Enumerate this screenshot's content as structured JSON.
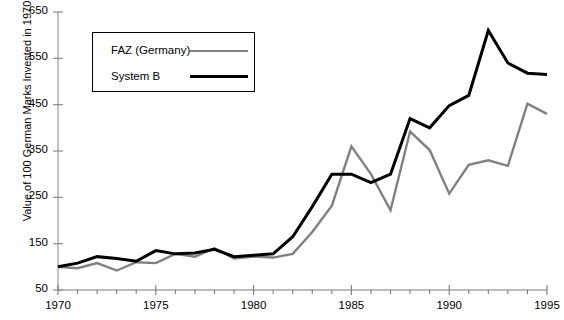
{
  "chart_data": {
    "type": "line",
    "title": "",
    "xlabel": "",
    "ylabel": "Value of 100 German Marks Invested in 1970",
    "xlim": [
      1970,
      1995
    ],
    "ylim": [
      50,
      650
    ],
    "ytick_step": 100,
    "yticks": [
      50,
      150,
      250,
      350,
      450,
      550,
      650
    ],
    "ytick_labels": [
      "50",
      "150",
      "250",
      "350",
      "450",
      "550",
      "650"
    ],
    "xticks": [
      1970,
      1971,
      1972,
      1973,
      1974,
      1975,
      1976,
      1977,
      1978,
      1979,
      1980,
      1981,
      1982,
      1983,
      1984,
      1985,
      1986,
      1987,
      1988,
      1989,
      1990,
      1991,
      1992,
      1993,
      1994,
      1995
    ],
    "xtick_labels_shown": [
      "1970",
      "1975",
      "1980",
      "1985",
      "1990",
      "1995"
    ],
    "xtick_labels_shown_values": [
      1970,
      1975,
      1980,
      1985,
      1990,
      1995
    ],
    "grid": false,
    "legend_position": "upper-left-inset",
    "x": [
      1970,
      1971,
      1972,
      1973,
      1974,
      1975,
      1976,
      1977,
      1978,
      1979,
      1980,
      1981,
      1982,
      1983,
      1984,
      1985,
      1986,
      1987,
      1988,
      1989,
      1990,
      1991,
      1992,
      1993,
      1994,
      1995
    ],
    "series": [
      {
        "name": "FAZ (Germany)",
        "color": "#808080",
        "width": 2.4,
        "values": [
          100,
          97,
          108,
          92,
          110,
          108,
          128,
          122,
          140,
          118,
          122,
          120,
          128,
          175,
          232,
          360,
          300,
          222,
          392,
          352,
          258,
          320,
          330,
          318,
          452,
          430
        ]
      },
      {
        "name": "System B",
        "color": "#000000",
        "width": 3.0,
        "values": [
          100,
          108,
          122,
          118,
          112,
          135,
          128,
          130,
          138,
          122,
          125,
          128,
          165,
          230,
          300,
          300,
          282,
          300,
          420,
          400,
          448,
          470,
          610,
          540,
          518,
          515
        ]
      }
    ]
  },
  "legend": {
    "items": [
      {
        "label": "FAZ (Germany)"
      },
      {
        "label": "System B"
      }
    ]
  }
}
